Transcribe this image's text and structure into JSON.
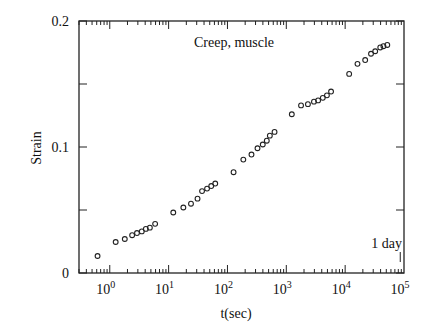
{
  "chart_data": {
    "type": "scatter",
    "title": "",
    "annotation": "Creep, muscle",
    "marker_annotation": {
      "label": "1 day",
      "x": 86400
    },
    "xlabel": "t(sec)",
    "ylabel": "Strain",
    "xscale": "log",
    "xlim": [
      0.3,
      100000
    ],
    "ylim": [
      0,
      0.2
    ],
    "x_tick_labels": [
      {
        "base": "10",
        "exp": "0",
        "value": 1
      },
      {
        "base": "10",
        "exp": "1",
        "value": 10
      },
      {
        "base": "10",
        "exp": "2",
        "value": 100
      },
      {
        "base": "10",
        "exp": "3",
        "value": 1000
      },
      {
        "base": "10",
        "exp": "4",
        "value": 10000
      },
      {
        "base": "10",
        "exp": "5",
        "value": 100000
      }
    ],
    "y_tick_labels": [
      {
        "label": "0",
        "value": 0
      },
      {
        "label": "0.1",
        "value": 0.1
      },
      {
        "label": "0.2",
        "value": 0.2
      }
    ],
    "y_minor_ticks": [
      0.05,
      0.15
    ],
    "grid": false,
    "legend": null,
    "marker": "open-circle",
    "series": [
      {
        "name": "Creep, muscle",
        "x": [
          0.62,
          1.26,
          1.8,
          2.4,
          2.9,
          3.5,
          4.1,
          4.8,
          5.9,
          12,
          17.8,
          24,
          31,
          37,
          45,
          53,
          62,
          127,
          186,
          256,
          324,
          398,
          466,
          525,
          631,
          1240,
          1780,
          2330,
          2950,
          3470,
          4170,
          4900,
          5760,
          11700,
          16200,
          21900,
          27500,
          32400,
          39500,
          44700,
          52000
        ],
        "y": [
          0.0135,
          0.0246,
          0.027,
          0.03,
          0.0317,
          0.033,
          0.035,
          0.036,
          0.039,
          0.048,
          0.052,
          0.055,
          0.059,
          0.065,
          0.067,
          0.069,
          0.071,
          0.08,
          0.09,
          0.094,
          0.099,
          0.102,
          0.105,
          0.109,
          0.112,
          0.126,
          0.133,
          0.134,
          0.136,
          0.137,
          0.139,
          0.141,
          0.144,
          0.158,
          0.166,
          0.169,
          0.174,
          0.176,
          0.179,
          0.18,
          0.181
        ]
      }
    ]
  }
}
